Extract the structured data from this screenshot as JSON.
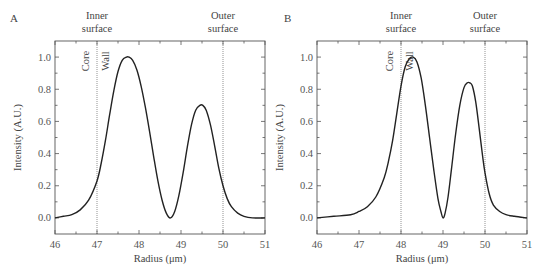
{
  "chart_data": [
    {
      "type": "line",
      "panel_label": "A",
      "xlabel": "Radius (μm)",
      "ylabel": "Intensity (A.U.)",
      "xlim": [
        46,
        51
      ],
      "ylim": [
        -0.1,
        1.1
      ],
      "xticks": [
        46,
        47,
        48,
        49,
        50,
        51
      ],
      "yticks": [
        0.0,
        0.2,
        0.4,
        0.6,
        0.8,
        1.0
      ],
      "ytick_labels": [
        "0.0",
        "0.2",
        "0.4",
        "0.6",
        "0.8",
        "1.0"
      ],
      "vlines": [
        47,
        50
      ],
      "annotations": {
        "inner_surface": "Inner\nsurface",
        "outer_surface": "Outer\nsurface",
        "core": "Core",
        "wall": "Wall"
      },
      "series": [
        {
          "name": "intensity",
          "x": [
            46.0,
            46.2,
            46.4,
            46.6,
            46.8,
            47.0,
            47.1,
            47.2,
            47.3,
            47.4,
            47.5,
            47.6,
            47.7,
            47.76,
            47.85,
            47.95,
            48.05,
            48.15,
            48.25,
            48.35,
            48.45,
            48.55,
            48.65,
            48.75,
            48.85,
            48.95,
            49.05,
            49.15,
            49.25,
            49.35,
            49.45,
            49.52,
            49.6,
            49.7,
            49.8,
            49.9,
            50.0,
            50.1,
            50.2,
            50.35,
            50.5,
            50.7,
            51.0
          ],
          "y": [
            0.0,
            0.01,
            0.02,
            0.05,
            0.11,
            0.23,
            0.34,
            0.48,
            0.64,
            0.79,
            0.91,
            0.98,
            1.0,
            1.0,
            0.98,
            0.92,
            0.82,
            0.69,
            0.54,
            0.38,
            0.23,
            0.11,
            0.03,
            0.0,
            0.04,
            0.14,
            0.28,
            0.44,
            0.58,
            0.67,
            0.7,
            0.7,
            0.67,
            0.58,
            0.45,
            0.31,
            0.2,
            0.12,
            0.07,
            0.03,
            0.01,
            0.0,
            0.0
          ]
        }
      ]
    },
    {
      "type": "line",
      "panel_label": "B",
      "xlabel": "Radius (μm)",
      "ylabel": "Intensity (A.U.)",
      "xlim": [
        46,
        51
      ],
      "ylim": [
        -0.1,
        1.1
      ],
      "xticks": [
        46,
        47,
        48,
        49,
        50,
        51
      ],
      "yticks": [
        0.0,
        0.2,
        0.4,
        0.6,
        0.8,
        1.0
      ],
      "ytick_labels": [
        "0.0",
        "0.2",
        "0.4",
        "0.6",
        "0.8",
        "1.0"
      ],
      "vlines": [
        48,
        50
      ],
      "annotations": {
        "inner_surface": "Inner\nsurface",
        "outer_surface": "Outer\nsurface",
        "core": "Core",
        "wall": "Wall"
      },
      "series": [
        {
          "name": "intensity",
          "x": [
            46.0,
            46.4,
            46.8,
            47.0,
            47.2,
            47.4,
            47.6,
            47.7,
            47.8,
            47.9,
            48.0,
            48.1,
            48.2,
            48.29,
            48.38,
            48.48,
            48.58,
            48.68,
            48.78,
            48.88,
            48.95,
            49.0,
            49.05,
            49.12,
            49.2,
            49.3,
            49.4,
            49.5,
            49.58,
            49.64,
            49.7,
            49.78,
            49.86,
            49.94,
            50.0,
            50.1,
            50.2,
            50.35,
            50.5,
            50.7,
            51.0
          ],
          "y": [
            0.0,
            0.01,
            0.02,
            0.04,
            0.07,
            0.13,
            0.25,
            0.35,
            0.48,
            0.65,
            0.82,
            0.94,
            0.99,
            1.0,
            0.97,
            0.87,
            0.7,
            0.5,
            0.3,
            0.12,
            0.04,
            0.0,
            0.03,
            0.13,
            0.3,
            0.52,
            0.7,
            0.81,
            0.84,
            0.84,
            0.82,
            0.72,
            0.56,
            0.39,
            0.28,
            0.15,
            0.08,
            0.04,
            0.02,
            0.01,
            0.0
          ]
        }
      ]
    }
  ]
}
